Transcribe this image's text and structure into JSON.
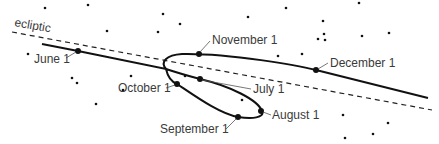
{
  "diagram": {
    "ecliptic_label": "ecliptic",
    "dates": [
      {
        "label": "June 1",
        "x": 78,
        "y": 51,
        "lx": 34,
        "ly": 63,
        "tx1": 66,
        "ty1": 58,
        "tx2": 76,
        "ty2": 52
      },
      {
        "label": "July 1",
        "x": 200,
        "y": 79,
        "lx": 253,
        "ly": 93,
        "tx1": 251,
        "ty1": 89,
        "tx2": 202,
        "ty2": 80
      },
      {
        "label": "August 1",
        "x": 261,
        "y": 111,
        "lx": 272,
        "ly": 119,
        "tx1": 271,
        "ty1": 115,
        "tx2": 263,
        "ty2": 112
      },
      {
        "label": "September 1",
        "x": 238,
        "y": 117,
        "lx": 160,
        "ly": 133,
        "tx1": 226,
        "ty1": 129,
        "tx2": 236,
        "ty2": 119
      },
      {
        "label": "October 1",
        "x": 177,
        "y": 84,
        "lx": 118,
        "ly": 92,
        "tx1": 166,
        "ty1": 88,
        "tx2": 175,
        "ty2": 85
      },
      {
        "label": "November 1",
        "x": 199,
        "y": 54,
        "lx": 212,
        "ly": 44,
        "tx1": 210,
        "ty1": 41,
        "tx2": 200,
        "ty2": 52
      },
      {
        "label": "December 1",
        "x": 316,
        "y": 70,
        "lx": 330,
        "ly": 67,
        "tx1": 328,
        "ty1": 63,
        "tx2": 318,
        "ty2": 69
      }
    ],
    "stars": [
      [
        45,
        8
      ],
      [
        88,
        5
      ],
      [
        163,
        14
      ],
      [
        180,
        24
      ],
      [
        107,
        31
      ],
      [
        158,
        32
      ],
      [
        28,
        54
      ],
      [
        248,
        17
      ],
      [
        286,
        8
      ],
      [
        323,
        21
      ],
      [
        359,
        3
      ],
      [
        324,
        34
      ],
      [
        325,
        40
      ],
      [
        318,
        39
      ],
      [
        362,
        36
      ],
      [
        389,
        33
      ],
      [
        278,
        56
      ],
      [
        302,
        54
      ],
      [
        72,
        78
      ],
      [
        77,
        83
      ],
      [
        131,
        76
      ],
      [
        123,
        90
      ],
      [
        96,
        104
      ],
      [
        185,
        76
      ],
      [
        242,
        100
      ],
      [
        343,
        115
      ],
      [
        388,
        123
      ],
      [
        345,
        138
      ],
      [
        373,
        134
      ]
    ],
    "colors": {
      "line": "#111111",
      "text": "#3a3a3a",
      "background": "#ffffff"
    }
  }
}
